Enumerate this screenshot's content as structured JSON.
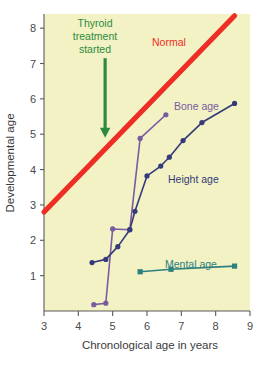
{
  "chart_data": {
    "type": "line",
    "title": "",
    "xlabel": "Chronological age in years",
    "ylabel": "Developmental age",
    "xlim": [
      3,
      9
    ],
    "ylim": [
      0,
      8.4
    ],
    "xticks": [
      3,
      4,
      5,
      6,
      7,
      8,
      9
    ],
    "yticks": [
      1,
      2,
      3,
      4,
      5,
      6,
      7,
      8
    ],
    "grid": false,
    "legend_position": "inline-labels",
    "plot_background": "#f2f2c4",
    "series": [
      {
        "name": "Normal",
        "label": "Normal",
        "type": "reference-line",
        "color": "#ee2d24",
        "marker": "none",
        "x": [
          3,
          8.55
        ],
        "values": [
          2.8,
          8.35
        ]
      },
      {
        "name": "Bone age",
        "label": "Bone age",
        "type": "line",
        "color": "#7b5ba0",
        "marker": "circle",
        "x": [
          4.45,
          4.8,
          5.0,
          5.5,
          5.8,
          6.55
        ],
        "values": [
          0.18,
          0.22,
          2.32,
          2.3,
          4.88,
          5.55
        ]
      },
      {
        "name": "Height age",
        "label": "Height age",
        "type": "line",
        "color": "#343a7a",
        "marker": "circle",
        "x": [
          4.4,
          4.8,
          5.15,
          5.5,
          5.65,
          6.0,
          6.4,
          6.65,
          7.05,
          7.6,
          8.55
        ],
        "values": [
          1.37,
          1.46,
          1.82,
          2.3,
          2.82,
          3.82,
          4.1,
          4.35,
          4.82,
          5.33,
          5.87
        ]
      },
      {
        "name": "Mental age",
        "label": "Mental age",
        "type": "line",
        "color": "#2e7f7f",
        "marker": "square",
        "x": [
          5.8,
          6.7,
          8.55
        ],
        "values": [
          1.11,
          1.18,
          1.27
        ]
      }
    ],
    "annotations": [
      {
        "name": "thyroid-treatment",
        "text_lines": [
          "Thyroid",
          "treatment",
          "started"
        ],
        "color": "#2f8a3e",
        "arrow": {
          "x": 4.78,
          "y_start": 7.15,
          "y_end": 4.9
        }
      }
    ]
  },
  "labels": {
    "x_axis": "Chronological age in years",
    "y_axis": "Developmental age",
    "normal": "Normal",
    "bone_age": "Bone age",
    "height_age": "Height age",
    "mental_age": "Mental age",
    "thyroid_line1": "Thyroid",
    "thyroid_line2": "treatment",
    "thyroid_line3": "started"
  },
  "ticks": {
    "x": [
      "3",
      "4",
      "5",
      "6",
      "7",
      "8",
      "9"
    ],
    "y": [
      "1",
      "2",
      "3",
      "4",
      "5",
      "6",
      "7",
      "8"
    ]
  }
}
